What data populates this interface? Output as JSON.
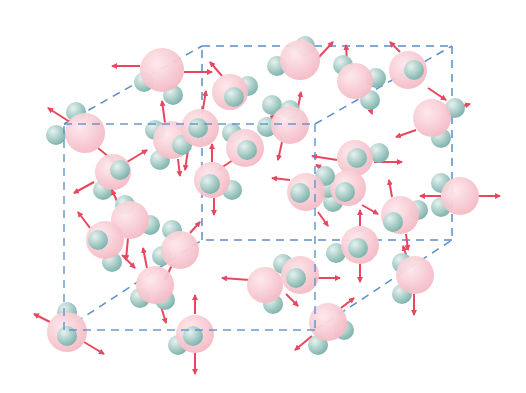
{
  "diagram": {
    "title": "Water molecules in random motion within a cubic region",
    "colors": {
      "oxygen": "#f4b8c3",
      "oxygen_light": "#fde8ec",
      "hydrogen": "#7fb3ad",
      "hydrogen_light": "#e6f2ef",
      "arrow": "#e8475f",
      "box_line": "#5b8fc9",
      "background": "#ffffff"
    },
    "box": {
      "front": [
        [
          64,
          124
        ],
        [
          315,
          124
        ],
        [
          315,
          330
        ],
        [
          64,
          330
        ]
      ],
      "back": [
        [
          202,
          46
        ],
        [
          452,
          46
        ],
        [
          452,
          240
        ],
        [
          202,
          240
        ]
      ]
    },
    "molecules": [
      {
        "o": [
          162,
          70
        ],
        "r": 22,
        "h": [
          [
            144,
            82
          ],
          [
            173,
            95
          ]
        ],
        "arrows": [
          [
            140,
            66,
            112,
            66
          ],
          [
            184,
            72,
            212,
            72
          ]
        ]
      },
      {
        "o": [
          85,
          133
        ],
        "r": 20,
        "h": [
          [
            76,
            112
          ],
          [
            56,
            135
          ]
        ],
        "arrows": [
          [
            70,
            122,
            48,
            108
          ],
          [
            98,
            148,
            115,
            162
          ]
        ]
      },
      {
        "o": [
          113,
          172
        ],
        "r": 18,
        "h": [
          [
            120,
            170
          ],
          [
            103,
            190
          ]
        ],
        "arrows": [
          [
            127,
            162,
            147,
            150
          ],
          [
            94,
            182,
            74,
            193
          ]
        ]
      },
      {
        "o": [
          172,
          140
        ],
        "r": 19,
        "h": [
          [
            155,
            130
          ],
          [
            160,
            160
          ]
        ],
        "arrows": [
          [
            165,
            123,
            162,
            101
          ],
          [
            178,
            159,
            180,
            176
          ]
        ]
      },
      {
        "o": [
          200,
          128
        ],
        "r": 19,
        "h": [
          [
            198,
            128
          ],
          [
            182,
            145
          ]
        ],
        "arrows": [
          [
            203,
            109,
            206,
            91
          ],
          [
            188,
            150,
            185,
            170
          ]
        ]
      },
      {
        "o": [
          230,
          92
        ],
        "r": 18,
        "h": [
          [
            248,
            86
          ],
          [
            234,
            97
          ]
        ],
        "arrows": [
          [
            222,
            76,
            210,
            62
          ]
        ]
      },
      {
        "o": [
          300,
          60
        ],
        "r": 20,
        "h": [
          [
            277,
            66
          ],
          [
            305,
            46
          ]
        ],
        "arrows": [
          [
            318,
            58,
            333,
            42
          ]
        ]
      },
      {
        "o": [
          245,
          148
        ],
        "r": 19,
        "h": [
          [
            247,
            150
          ],
          [
            232,
            133
          ]
        ],
        "arrows": [
          [
            258,
            130,
            275,
            115
          ],
          [
            233,
            160,
            218,
            170
          ]
        ]
      },
      {
        "o": [
          212,
          180
        ],
        "r": 18,
        "h": [
          [
            210,
            184
          ],
          [
            232,
            190
          ]
        ],
        "arrows": [
          [
            212,
            162,
            212,
            144
          ],
          [
            214,
            198,
            214,
            215
          ]
        ]
      },
      {
        "o": [
          290,
          125
        ],
        "r": 19,
        "h": [
          [
            267,
            127
          ],
          [
            272,
            105
          ],
          [
            290,
            110
          ]
        ],
        "arrows": [
          [
            298,
            108,
            301,
            92
          ],
          [
            282,
            142,
            278,
            160
          ]
        ]
      },
      {
        "o": [
          355,
          81
        ],
        "r": 18,
        "h": [
          [
            343,
            65
          ],
          [
            376,
            78
          ],
          [
            370,
            100
          ]
        ],
        "arrows": [
          [
            347,
            62,
            346,
            45
          ],
          [
            366,
            97,
            372,
            114
          ]
        ]
      },
      {
        "o": [
          408,
          70
        ],
        "r": 19,
        "h": [
          [
            414,
            70
          ]
        ],
        "arrows": [
          [
            400,
            52,
            390,
            42
          ],
          [
            428,
            88,
            446,
            100
          ]
        ]
      },
      {
        "o": [
          432,
          118
        ],
        "r": 19,
        "h": [
          [
            455,
            108
          ],
          [
            441,
            138
          ]
        ],
        "arrows": [
          [
            455,
            108,
            470,
            104
          ],
          [
            416,
            130,
            396,
            137
          ]
        ]
      },
      {
        "o": [
          355,
          158
        ],
        "r": 18,
        "h": [
          [
            357,
            158
          ],
          [
            379,
            153
          ]
        ],
        "arrows": [
          [
            337,
            160,
            312,
            156
          ],
          [
            374,
            162,
            402,
            162
          ]
        ]
      },
      {
        "o": [
          348,
          188
        ],
        "r": 18,
        "h": [
          [
            345,
            192
          ],
          [
            333,
            202
          ],
          [
            328,
            188
          ]
        ],
        "arrows": [
          [
            330,
            172,
            316,
            165
          ],
          [
            332,
            190,
            305,
            188
          ],
          [
            362,
            205,
            378,
            214
          ]
        ]
      },
      {
        "o": [
          306,
          192
        ],
        "r": 19,
        "h": [
          [
            300,
            193
          ],
          [
            325,
            176
          ]
        ],
        "arrows": [
          [
            290,
            180,
            272,
            178
          ],
          [
            318,
            212,
            328,
            226
          ]
        ]
      },
      {
        "o": [
          400,
          215
        ],
        "r": 19,
        "h": [
          [
            393,
            222
          ],
          [
            418,
            210
          ]
        ],
        "arrows": [
          [
            392,
            197,
            389,
            180
          ],
          [
            406,
            234,
            408,
            250
          ]
        ]
      },
      {
        "o": [
          460,
          196
        ],
        "r": 19,
        "h": [
          [
            441,
            183
          ],
          [
            441,
            207
          ]
        ],
        "arrows": [
          [
            441,
            196,
            420,
            196
          ],
          [
            478,
            196,
            500,
            196
          ]
        ]
      },
      {
        "o": [
          130,
          220
        ],
        "r": 19,
        "h": [
          [
            125,
            205
          ],
          [
            150,
            225
          ]
        ],
        "arrows": [
          [
            128,
            238,
            126,
            260
          ],
          [
            120,
            208,
            112,
            190
          ]
        ]
      },
      {
        "o": [
          105,
          240
        ],
        "r": 19,
        "h": [
          [
            98,
            240
          ],
          [
            112,
            262
          ]
        ],
        "arrows": [
          [
            90,
            228,
            78,
            212
          ],
          [
            122,
            255,
            135,
            268
          ]
        ]
      },
      {
        "o": [
          180,
          250
        ],
        "r": 19,
        "h": [
          [
            172,
            230
          ],
          [
            162,
            256
          ]
        ],
        "arrows": [
          [
            190,
            233,
            200,
            222
          ],
          [
            172,
            265,
            165,
            280
          ]
        ]
      },
      {
        "o": [
          155,
          285
        ],
        "r": 19,
        "h": [
          [
            140,
            298
          ],
          [
            165,
            300
          ]
        ],
        "arrows": [
          [
            147,
            268,
            143,
            248
          ],
          [
            160,
            303,
            166,
            323
          ]
        ]
      },
      {
        "o": [
          67,
          332
        ],
        "r": 20,
        "h": [
          [
            67,
            312
          ],
          [
            67,
            336
          ]
        ],
        "arrows": [
          [
            50,
            322,
            34,
            314
          ],
          [
            84,
            342,
            104,
            354
          ]
        ]
      },
      {
        "o": [
          195,
          334
        ],
        "r": 19,
        "h": [
          [
            193,
            336
          ],
          [
            178,
            345
          ]
        ],
        "arrows": [
          [
            195,
            314,
            195,
            295
          ],
          [
            195,
            353,
            195,
            374
          ]
        ]
      },
      {
        "o": [
          265,
          285
        ],
        "r": 18,
        "h": [
          [
            290,
            270
          ],
          [
            273,
            304
          ]
        ],
        "arrows": [
          [
            250,
            280,
            222,
            278
          ],
          [
            282,
            268,
            296,
            260
          ]
        ]
      },
      {
        "o": [
          300,
          275
        ],
        "r": 19,
        "h": [
          [
            296,
            278
          ],
          [
            283,
            264
          ]
        ],
        "arrows": [
          [
            318,
            278,
            340,
            278
          ],
          [
            286,
            294,
            298,
            306
          ]
        ]
      },
      {
        "o": [
          360,
          245
        ],
        "r": 19,
        "h": [
          [
            358,
            248
          ],
          [
            336,
            253
          ]
        ],
        "arrows": [
          [
            360,
            226,
            360,
            210
          ],
          [
            360,
            264,
            360,
            282
          ]
        ]
      },
      {
        "o": [
          328,
          322
        ],
        "r": 19,
        "h": [
          [
            318,
            345
          ],
          [
            344,
            330
          ]
        ],
        "arrows": [
          [
            341,
            308,
            354,
            298
          ],
          [
            312,
            336,
            295,
            350
          ]
        ]
      },
      {
        "o": [
          415,
          275
        ],
        "r": 19,
        "h": [
          [
            402,
            263
          ],
          [
            402,
            294
          ]
        ],
        "arrows": [
          [
            408,
            260,
            403,
            246
          ],
          [
            414,
            294,
            414,
            315
          ]
        ]
      }
    ]
  }
}
